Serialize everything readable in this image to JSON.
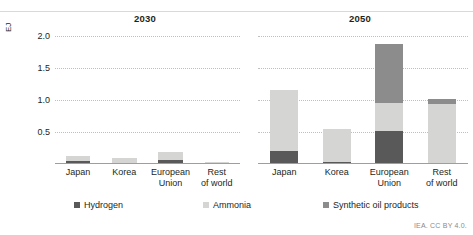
{
  "attribution": "IEA. CC BY 4.0.",
  "axis": {
    "ylabel": "EJ",
    "yticks": [
      "2.0",
      "1.5",
      "1.0",
      "0.5"
    ]
  },
  "legend": [
    {
      "key": "hydrogen",
      "label": "Hydrogen",
      "color": "#595959"
    },
    {
      "key": "ammonia",
      "label": "Ammonia",
      "color": "#d5d5d3"
    },
    {
      "key": "synthetic",
      "label": "Synthetic oil products",
      "color": "#8c8c8c"
    }
  ],
  "panels": [
    {
      "title": "2030",
      "categories": [
        {
          "line1": "Japan",
          "line2": ""
        },
        {
          "line1": "Korea",
          "line2": ""
        },
        {
          "line1": "European",
          "line2": "Union"
        },
        {
          "line1": "Rest",
          "line2": "of world"
        }
      ]
    },
    {
      "title": "2050",
      "categories": [
        {
          "line1": "Japan",
          "line2": ""
        },
        {
          "line1": "Korea",
          "line2": ""
        },
        {
          "line1": "European",
          "line2": "Union"
        },
        {
          "line1": "Rest",
          "line2": "of world"
        }
      ]
    }
  ],
  "chart_data": {
    "type": "bar",
    "title": "",
    "xlabel": "",
    "ylabel": "EJ",
    "ylim": [
      0,
      2.2
    ],
    "yticks": [
      0.5,
      1.0,
      1.5,
      2.0
    ],
    "grid": true,
    "stacked": true,
    "legend_position": "bottom",
    "panels": [
      {
        "title": "2030",
        "categories": [
          "Japan",
          "Korea",
          "European Union",
          "Rest of world"
        ],
        "series": [
          {
            "name": "Hydrogen",
            "color": "#595959",
            "values": [
              0.06,
              0.01,
              0.07,
              0.01
            ]
          },
          {
            "name": "Ammonia",
            "color": "#d5d5d3",
            "values": [
              0.08,
              0.1,
              0.13,
              0.02
            ]
          },
          {
            "name": "Synthetic oil products",
            "color": "#8c8c8c",
            "values": [
              0.0,
              0.0,
              0.0,
              0.0
            ]
          }
        ],
        "totals": [
          0.14,
          0.11,
          0.2,
          0.03
        ]
      },
      {
        "title": "2050",
        "categories": [
          "Japan",
          "Korea",
          "European Union",
          "Rest of world"
        ],
        "series": [
          {
            "name": "Hydrogen",
            "color": "#595959",
            "values": [
              0.22,
              0.03,
              0.57,
              0.0
            ]
          },
          {
            "name": "Ammonia",
            "color": "#d5d5d3",
            "values": [
              1.05,
              0.57,
              0.48,
              1.03
            ]
          },
          {
            "name": "Synthetic oil products",
            "color": "#8c8c8c",
            "values": [
              0.0,
              0.0,
              1.02,
              0.09
            ]
          }
        ],
        "totals": [
          1.27,
          0.6,
          2.07,
          1.12
        ]
      }
    ]
  }
}
